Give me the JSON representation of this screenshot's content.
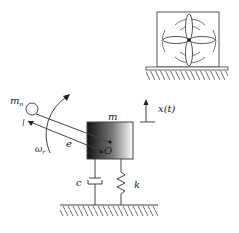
{
  "diagram": {
    "inset": {
      "name": "fan-on-base",
      "description": "Fan with four blades mounted in square frame on ground"
    },
    "labels": {
      "unbalance_mass": "m",
      "unbalance_mass_sub": "o",
      "main_mass": "m",
      "eccentricity": "e",
      "rotation_speed": "ω",
      "rotation_speed_sub": "r",
      "pivot": "O",
      "displacement": "x(t)",
      "damper": "c",
      "spring": "k"
    },
    "colors": {
      "line": "#333333",
      "background": "#ffffff",
      "shade": "#1a1a1a"
    }
  }
}
